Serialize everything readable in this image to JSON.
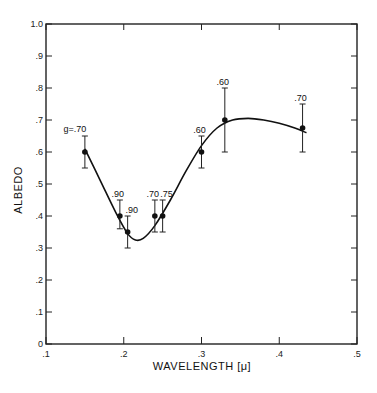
{
  "chart_data": {
    "type": "scatter",
    "title": "",
    "xlabel": "WAVELENGTH [μ]",
    "ylabel": "ALBEDO",
    "xlim": [
      0.1,
      0.5
    ],
    "ylim": [
      0.0,
      1.0
    ],
    "x_ticks": [
      ".1",
      ".2",
      ".3",
      ".4",
      ".5"
    ],
    "x_tick_values": [
      0.1,
      0.2,
      0.3,
      0.4,
      0.5
    ],
    "y_ticks": [
      "0",
      ".1",
      ".2",
      ".3",
      ".4",
      ".5",
      ".6",
      ".7",
      ".8",
      ".9",
      "1.0"
    ],
    "y_tick_values": [
      0.0,
      0.1,
      0.2,
      0.3,
      0.4,
      0.5,
      0.6,
      0.7,
      0.8,
      0.9,
      1.0
    ],
    "grid": false,
    "legend": null,
    "series": [
      {
        "name": "measured albedo",
        "points": [
          {
            "x": 0.15,
            "y": 0.6,
            "err_low": 0.55,
            "err_high": 0.65,
            "label": "g=.70"
          },
          {
            "x": 0.195,
            "y": 0.4,
            "err_low": 0.36,
            "err_high": 0.45,
            "label": ".90"
          },
          {
            "x": 0.205,
            "y": 0.35,
            "err_low": 0.3,
            "err_high": 0.4,
            "label": ".90"
          },
          {
            "x": 0.24,
            "y": 0.4,
            "err_low": 0.35,
            "err_high": 0.45,
            "label": ".70"
          },
          {
            "x": 0.25,
            "y": 0.4,
            "err_low": 0.35,
            "err_high": 0.45,
            "label": ".75"
          },
          {
            "x": 0.3,
            "y": 0.6,
            "err_low": 0.55,
            "err_high": 0.65,
            "label": ".60"
          },
          {
            "x": 0.33,
            "y": 0.7,
            "err_low": 0.6,
            "err_high": 0.8,
            "label": ".60"
          },
          {
            "x": 0.43,
            "y": 0.675,
            "err_low": 0.6,
            "err_high": 0.75,
            "label": ".70"
          }
        ]
      },
      {
        "name": "fitted curve",
        "type": "line",
        "x": [
          0.15,
          0.17,
          0.19,
          0.205,
          0.215,
          0.225,
          0.24,
          0.26,
          0.28,
          0.3,
          0.32,
          0.34,
          0.36,
          0.38,
          0.4,
          0.42,
          0.435
        ],
        "y": [
          0.61,
          0.51,
          0.41,
          0.345,
          0.325,
          0.33,
          0.37,
          0.45,
          0.54,
          0.62,
          0.675,
          0.7,
          0.705,
          0.7,
          0.69,
          0.675,
          0.66
        ]
      }
    ],
    "annotations": [
      "g=.70",
      ".90",
      ".90",
      ".70",
      ".75",
      ".60",
      ".60",
      ".70"
    ]
  }
}
